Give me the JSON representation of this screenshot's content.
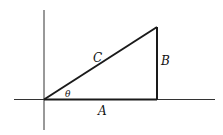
{
  "diagram": {
    "type": "right-triangle",
    "labels": {
      "hypotenuse": "C",
      "opposite": "B",
      "adjacent": "A",
      "angle": "θ"
    },
    "colors": {
      "stroke": "#1a1a1a",
      "axis": "#333333",
      "background": "#ffffff"
    }
  }
}
